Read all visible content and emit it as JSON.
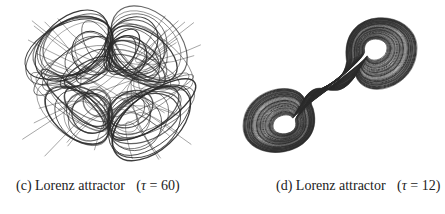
{
  "figures": [
    {
      "id": "c",
      "label": "(c)",
      "title": "Lorenz attractor",
      "param_open": "(",
      "param_symbol": "τ",
      "param_eq": " = ",
      "param_value": "60",
      "param_close": ")",
      "description": "Tangled four-lobed (cloverleaf) phase trajectory"
    },
    {
      "id": "d",
      "label": "(d)",
      "title": "Lorenz attractor",
      "param_open": "(",
      "param_symbol": "τ",
      "param_eq": " = ",
      "param_value": "12",
      "param_close": ")",
      "description": "Classic two-lobed butterfly phase trajectory, diagonal orientation"
    }
  ],
  "colors": {
    "stroke": "#2a2a2a",
    "background": "#ffffff",
    "text": "#222222"
  }
}
